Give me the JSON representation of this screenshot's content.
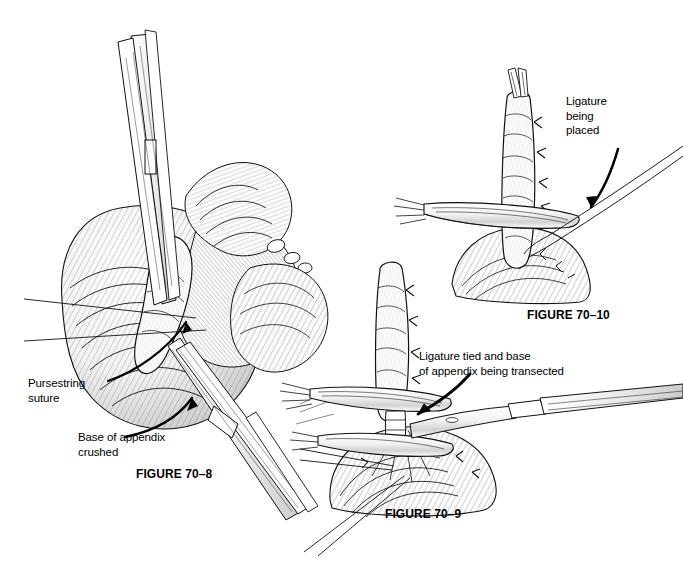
{
  "page": {
    "kind": "surgical-illustration-plate",
    "background_color": "#ffffff",
    "ink_color": "#000000",
    "width": 683,
    "height": 563
  },
  "figures": [
    {
      "id": "fig-70-8",
      "caption": "FIGURE 70–8",
      "subject": "Base of appendix crushed with a clamp; pursestring suture placed in cecum",
      "annotations": [
        {
          "id": "pursestring-suture",
          "text": "Pursestring\nsuture",
          "leader": "two-straight-lines"
        },
        {
          "id": "base-of-appendix-crushed",
          "text": "Base of appendix\ncrushed",
          "leader": "curved-arrow"
        }
      ]
    },
    {
      "id": "fig-70-9",
      "caption": "FIGURE 70–9",
      "subject": "Ligature tied at base of appendix; appendix transected with scalpel between clamps",
      "annotations": [
        {
          "id": "ligature-tied-transected",
          "text": "Ligature tied and base\nof appendix being transected",
          "leader": "curved-arrow"
        }
      ]
    },
    {
      "id": "fig-70-10",
      "caption": "FIGURE 70–10",
      "subject": "Ligature being placed around the base of the appendix beneath the clamp",
      "annotations": [
        {
          "id": "ligature-being-placed",
          "text": "Ligature\nbeing\nplaced",
          "leader": "curved-arrow"
        }
      ]
    }
  ],
  "labels": {
    "pursestring_suture": "Pursestring\nsuture",
    "base_of_appendix_crushed": "Base of appendix\ncrushed",
    "ligature_being_placed": "Ligature\nbeing\nplaced",
    "ligature_tied_and_transected": "Ligature tied and base\nof appendix being transected"
  },
  "captions": {
    "fig_70_8": "FIGURE 70–8",
    "fig_70_9": "FIGURE 70–9",
    "fig_70_10": "FIGURE 70–10"
  }
}
